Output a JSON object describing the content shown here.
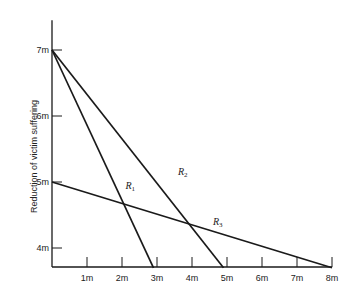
{
  "chart_data": {
    "type": "line",
    "title": "",
    "xlabel": "",
    "ylabel": "Reduction of victim suffering",
    "xlim": [
      0,
      8
    ],
    "ylim": [
      3.7,
      7.5
    ],
    "grid": false,
    "legend": "none (inline labels)",
    "x_ticks": [
      "1m",
      "2m",
      "3m",
      "4m",
      "5m",
      "6m",
      "7m",
      "8m"
    ],
    "y_ticks": [
      "4m",
      "5m",
      "6m",
      "7m"
    ],
    "series": [
      {
        "name": "R1",
        "label_main": "R",
        "label_sub": "1",
        "points": [
          [
            0,
            7
          ],
          [
            2.9,
            3.7
          ]
        ]
      },
      {
        "name": "R2",
        "label_main": "R",
        "label_sub": "2",
        "points": [
          [
            0,
            7
          ],
          [
            4.9,
            3.7
          ]
        ]
      },
      {
        "name": "R3",
        "label_main": "R",
        "label_sub": "3",
        "points": [
          [
            0,
            5
          ],
          [
            8,
            3.7
          ]
        ]
      }
    ],
    "annotations": [
      {
        "text": "R1",
        "near": [
          2.1,
          4.9
        ]
      },
      {
        "text": "R2",
        "near": [
          3.6,
          5.1
        ]
      },
      {
        "text": "R3",
        "near": [
          4.6,
          4.35
        ]
      }
    ]
  },
  "layout": {
    "origin_px": [
      52,
      267
    ],
    "x_px_per_unit": 35,
    "y0_value": 4,
    "y0_px": 248,
    "y_px_per_unit": 66,
    "line_color": "#1a1a1a"
  }
}
